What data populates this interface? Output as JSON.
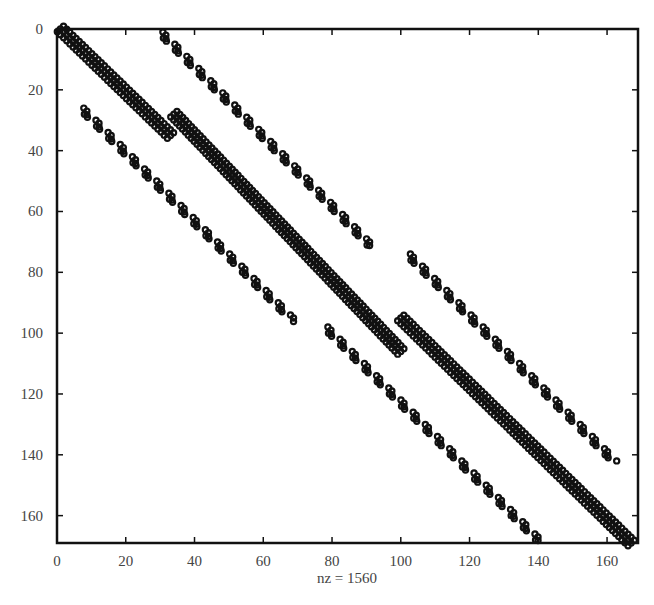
{
  "chart_data": {
    "type": "scatter",
    "subtype": "sparsity-pattern",
    "title": "",
    "xlabel": "nz = 1560",
    "ylabel": "",
    "xlim": [
      0,
      169
    ],
    "ylim": [
      169,
      0
    ],
    "x_ticks": [
      0,
      20,
      40,
      60,
      80,
      100,
      120,
      140,
      160
    ],
    "y_ticks": [
      0,
      20,
      40,
      60,
      80,
      100,
      120,
      140,
      160
    ],
    "grid": false,
    "nz": 1560,
    "marker_color": "#111111",
    "segments": [
      {
        "name": "main-diagonal-1",
        "style": "band",
        "from": [
          1,
          0
        ],
        "to": [
          33,
          35
        ]
      },
      {
        "name": "main-diagonal-2",
        "style": "band",
        "from": [
          34,
          28
        ],
        "to": [
          100,
          106
        ]
      },
      {
        "name": "main-diagonal-3",
        "style": "band",
        "from": [
          100,
          95
        ],
        "to": [
          167,
          169
        ]
      },
      {
        "name": "upper-offdiag-1",
        "style": "stepped",
        "from": [
          30,
          1
        ],
        "to": [
          91,
          71
        ]
      },
      {
        "name": "upper-offdiag-2",
        "style": "stepped",
        "from": [
          102,
          74
        ],
        "to": [
          162,
          142
        ]
      },
      {
        "name": "lower-offdiag-1",
        "style": "stepped",
        "from": [
          7,
          26
        ],
        "to": [
          68,
          95
        ]
      },
      {
        "name": "lower-offdiag-2",
        "style": "stepped",
        "from": [
          78,
          98
        ],
        "to": [
          140,
          168
        ]
      }
    ]
  }
}
